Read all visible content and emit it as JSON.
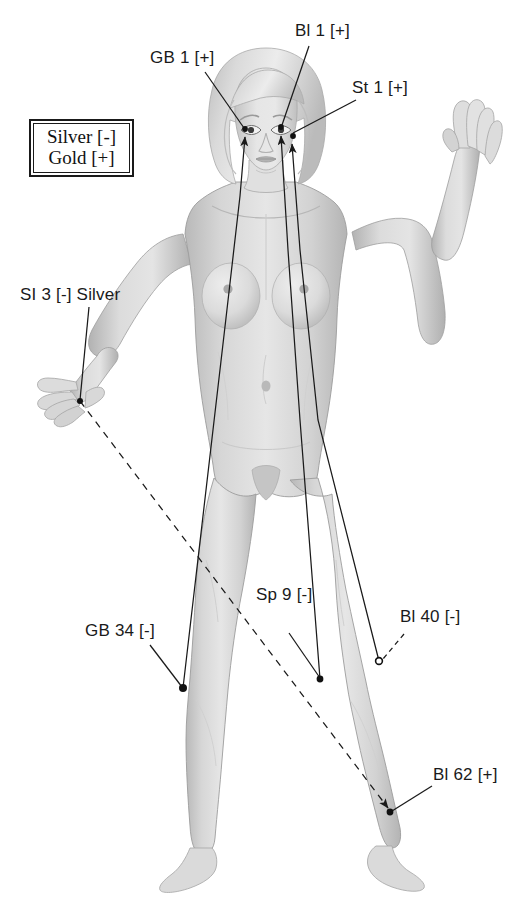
{
  "page": {
    "background_color": "#ffffff",
    "width": 511,
    "height": 899
  },
  "legend": {
    "name": "needle-metal-legend",
    "lines": [
      "Silver [-]",
      "Gold [+]"
    ],
    "silver": "Silver [-]",
    "gold": "Gold [+]",
    "border_color": "#1a1a1a"
  },
  "figure": {
    "fill": "#dcdcdc",
    "shade": "#bdbdbd",
    "outline": "#9a9a9a"
  },
  "style": {
    "line_color": "#1a1a1a",
    "text_color": "#1a1a1a",
    "marker_fill": "#111111"
  },
  "annotations": [
    {
      "id": "gb1",
      "label": "GB 1 [+]",
      "polarity": "+",
      "metal": "gold",
      "label_x": 150,
      "label_y": 48,
      "leader": "solid",
      "target_x": 245,
      "target_y": 129,
      "marker": "dot"
    },
    {
      "id": "bl1",
      "label": "Bl 1 [+]",
      "polarity": "+",
      "metal": "gold",
      "label_x": 295,
      "label_y": 21,
      "leader": "solid",
      "target_x": 281,
      "target_y": 127,
      "marker": "dot"
    },
    {
      "id": "st1",
      "label": "St 1 [+]",
      "polarity": "+",
      "metal": "gold",
      "label_x": 352,
      "label_y": 78,
      "leader": "solid",
      "target_x": 292,
      "target_y": 135,
      "marker": "dot"
    },
    {
      "id": "si3",
      "label": "SI 3 [-] Silver",
      "polarity": "-",
      "metal": "silver",
      "label_x": 20,
      "label_y": 285,
      "leader": "solid",
      "target_x": 80,
      "target_y": 401,
      "marker": "dot"
    },
    {
      "id": "gb34",
      "label": "GB 34 [-]",
      "polarity": "-",
      "metal": "silver",
      "label_x": 85,
      "label_y": 621,
      "leader": "solid",
      "target_x": 183,
      "target_y": 688,
      "marker": "dot"
    },
    {
      "id": "sp9",
      "label": "Sp 9 [-]",
      "polarity": "-",
      "metal": "silver",
      "label_x": 256,
      "label_y": 585,
      "leader": "solid",
      "target_x": 320,
      "target_y": 679,
      "marker": "dot"
    },
    {
      "id": "bl40",
      "label": "Bl 40 [-]",
      "polarity": "-",
      "metal": "silver",
      "label_x": 400,
      "label_y": 607,
      "leader": "dashed",
      "target_x": 379,
      "target_y": 661,
      "marker": "circle"
    },
    {
      "id": "bl62",
      "label": "Bl 62 [+]",
      "polarity": "+",
      "metal": "gold",
      "label_x": 433,
      "label_y": 765,
      "leader": "solid",
      "target_x": 390,
      "target_y": 812,
      "marker": "dot"
    }
  ],
  "connections": [
    {
      "id": "si3-to-bl62",
      "from": "si3",
      "to": "bl62",
      "style": "dashed",
      "arrowhead": true,
      "description": "silver SI 3 linked diagonally to gold Bl 62 at the ankle"
    },
    {
      "id": "gb34-to-gb1",
      "from": "gb34",
      "to": "gb1",
      "style": "solid",
      "arrowhead": true,
      "description": "silver GB 34 linked up the body to gold GB 1 at the eye"
    },
    {
      "id": "sp9-to-bl1",
      "from": "sp9",
      "to": "bl1",
      "style": "solid",
      "arrowhead": true,
      "description": "silver Sp 9 linked up the body to gold Bl 1 at the inner eye"
    },
    {
      "id": "bl40-to-st1",
      "from": "bl40",
      "to": "st1",
      "style": "solid",
      "arrowhead": true,
      "description": "silver Bl 40 linked up the body to gold St 1 below the eye"
    }
  ]
}
